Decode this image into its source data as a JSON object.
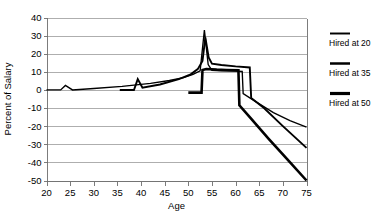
{
  "chart_data": {
    "type": "line",
    "title": "",
    "xlabel": "Age",
    "ylabel": "Percent of Salary",
    "xlim": [
      20,
      75
    ],
    "ylim": [
      -50,
      40
    ],
    "x_ticks": [
      20,
      25,
      30,
      35,
      40,
      45,
      50,
      55,
      60,
      65,
      70,
      75
    ],
    "y_ticks": [
      40,
      30,
      20,
      10,
      0,
      -10,
      -20,
      -30,
      -40,
      -50
    ],
    "grid": "horizontal",
    "legend_position": "right",
    "series": [
      {
        "name": "Hired at 20",
        "points": [
          [
            20,
            0
          ],
          [
            23,
            0
          ],
          [
            24,
            2.5
          ],
          [
            25.5,
            0
          ],
          [
            30,
            0.8
          ],
          [
            36,
            2.0
          ],
          [
            42,
            3.6
          ],
          [
            46,
            5.2
          ],
          [
            49,
            6.8
          ],
          [
            51,
            8.6
          ],
          [
            52.5,
            10.6
          ],
          [
            53.4,
            33.0
          ],
          [
            54.2,
            14.0
          ],
          [
            55,
            10.8
          ],
          [
            57,
            10.6
          ],
          [
            60,
            10.4
          ],
          [
            61.4,
            10.2
          ],
          [
            61.6,
            -2.0
          ],
          [
            64,
            -6.0
          ],
          [
            68,
            -12.5
          ],
          [
            71.5,
            -17.0
          ],
          [
            75,
            -20.5
          ]
        ]
      },
      {
        "name": "Hired at 35",
        "points": [
          [
            35.5,
            0
          ],
          [
            38.5,
            0
          ],
          [
            39.3,
            6.0
          ],
          [
            40.3,
            1.2
          ],
          [
            44,
            3.0
          ],
          [
            48,
            6.0
          ],
          [
            50.5,
            8.6
          ],
          [
            52,
            11.5
          ],
          [
            53,
            16.0
          ],
          [
            53.6,
            29.0
          ],
          [
            54.3,
            18.0
          ],
          [
            55,
            14.5
          ],
          [
            57,
            13.8
          ],
          [
            60,
            13.0
          ],
          [
            63,
            12.4
          ],
          [
            63.3,
            -4.5
          ],
          [
            66,
            -10.0
          ],
          [
            70,
            -20.0
          ],
          [
            75,
            -32.0
          ]
        ]
      },
      {
        "name": "Hired at 50",
        "points": [
          [
            50.0,
            -1.5
          ],
          [
            52.8,
            -1.5
          ],
          [
            53.0,
            11.0
          ],
          [
            53.8,
            11.6
          ],
          [
            56,
            11.2
          ],
          [
            58,
            11.0
          ],
          [
            60.6,
            10.8
          ],
          [
            60.8,
            -8.5
          ],
          [
            63,
            -15.0
          ],
          [
            67,
            -27.0
          ],
          [
            71,
            -38.5
          ],
          [
            75,
            -50.0
          ]
        ]
      }
    ]
  },
  "legend": {
    "items": [
      {
        "label": "Hired at 20"
      },
      {
        "label": "Hired at 35"
      },
      {
        "label": "Hired at 50"
      }
    ]
  },
  "axes": {
    "x_title": "Age",
    "y_title": "Percent of Salary"
  }
}
